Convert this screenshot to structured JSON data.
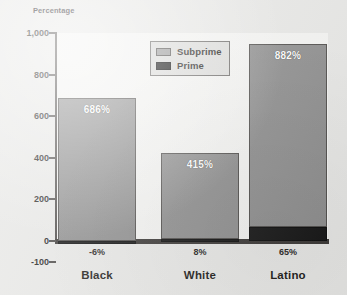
{
  "chart_data": {
    "type": "bar",
    "subtype": "stacked-bar",
    "title": "",
    "xlabel": "",
    "ylabel": "Percentage",
    "ylim": [
      -100,
      1000
    ],
    "yticks": [
      1000,
      800,
      600,
      400,
      200,
      0,
      -100
    ],
    "ytick_labels": [
      "1,000",
      "800",
      "600",
      "400",
      "200",
      "0",
      "-100"
    ],
    "grid": false,
    "legend_position": "top-center",
    "categories": [
      "Black",
      "White",
      "Latino"
    ],
    "series": [
      {
        "name": "Subprime",
        "color": "#8e8e8e",
        "values": [
          686,
          415,
          882
        ],
        "value_labels": [
          "686%",
          "415%",
          "882%"
        ]
      },
      {
        "name": "Prime",
        "color": "#141414",
        "values": [
          -6,
          8,
          65
        ],
        "value_labels": [
          "-6%",
          "8%",
          "65%"
        ]
      }
    ]
  },
  "axis": {
    "y_title": "Percentage"
  },
  "legend": {
    "items": [
      {
        "label": "Subprime",
        "swatch": "subprime-swatch"
      },
      {
        "label": "Prime",
        "swatch": "prime-swatch"
      }
    ]
  }
}
